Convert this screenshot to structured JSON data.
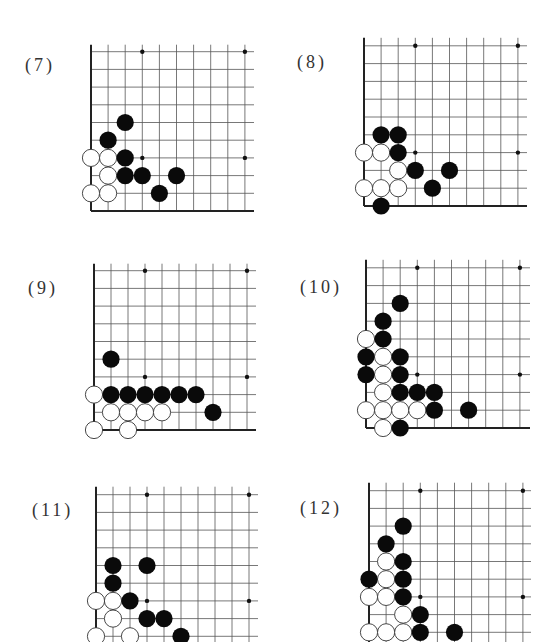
{
  "page": {
    "background": "#ffffff",
    "line_color": "#555555",
    "edge_color": "#222222",
    "black_stone": "#0a0a0a",
    "white_stone": "#ffffff"
  },
  "problems": [
    {
      "label": "(7)",
      "label_pos": [
        25,
        55
      ],
      "origin": [
        91,
        211
      ],
      "step": [
        17.1,
        17.7
      ],
      "cols": 10,
      "rows_shown": 10,
      "top_extra": 7,
      "right_extent": 254,
      "bottom_visible": true,
      "stars": [
        [
          3,
          3
        ],
        [
          9,
          3
        ],
        [
          3,
          9
        ],
        [
          9,
          9
        ]
      ],
      "black": [
        [
          2,
          5
        ],
        [
          1,
          4
        ],
        [
          2,
          3
        ],
        [
          2,
          2
        ],
        [
          3,
          2
        ],
        [
          5,
          2
        ],
        [
          4,
          1
        ]
      ],
      "white": [
        [
          0,
          3
        ],
        [
          1,
          3
        ],
        [
          1,
          2
        ],
        [
          0,
          1
        ],
        [
          1,
          1
        ]
      ]
    },
    {
      "label": "(8)",
      "label_pos": [
        297,
        52
      ],
      "origin": [
        364,
        206
      ],
      "step": [
        17.1,
        17.8
      ],
      "cols": 10,
      "rows_shown": 10,
      "top_extra": 8,
      "right_extent": 527,
      "bottom_visible": true,
      "stars": [
        [
          3,
          3
        ],
        [
          9,
          3
        ],
        [
          3,
          9
        ],
        [
          9,
          9
        ]
      ],
      "black": [
        [
          1,
          4
        ],
        [
          2,
          4
        ],
        [
          2,
          3
        ],
        [
          3,
          2
        ],
        [
          5,
          2
        ],
        [
          4,
          1
        ],
        [
          1,
          0
        ]
      ],
      "white": [
        [
          0,
          3
        ],
        [
          1,
          3
        ],
        [
          2,
          2
        ],
        [
          0,
          1
        ],
        [
          1,
          1
        ],
        [
          2,
          1
        ]
      ]
    },
    {
      "label": "(9)",
      "label_pos": [
        28,
        278
      ],
      "origin": [
        94,
        430
      ],
      "step": [
        17.0,
        17.7
      ],
      "cols": 10,
      "rows_shown": 10,
      "top_extra": 7,
      "right_extent": 256,
      "bottom_visible": true,
      "stars": [
        [
          3,
          3
        ],
        [
          9,
          3
        ],
        [
          3,
          9
        ],
        [
          9,
          9
        ]
      ],
      "black": [
        [
          1,
          4
        ],
        [
          1,
          2
        ],
        [
          2,
          2
        ],
        [
          3,
          2
        ],
        [
          4,
          2
        ],
        [
          5,
          2
        ],
        [
          6,
          2
        ],
        [
          7,
          1
        ]
      ],
      "white": [
        [
          0,
          2
        ],
        [
          1,
          1
        ],
        [
          2,
          1
        ],
        [
          3,
          1
        ],
        [
          4,
          1
        ],
        [
          0,
          0
        ],
        [
          2,
          0
        ]
      ]
    },
    {
      "label": "(10)",
      "label_pos": [
        300,
        277
      ],
      "origin": [
        366,
        428
      ],
      "step": [
        17.1,
        17.8
      ],
      "cols": 10,
      "rows_shown": 10,
      "top_extra": 8,
      "right_extent": 530,
      "bottom_visible": true,
      "stars": [
        [
          3,
          3
        ],
        [
          9,
          3
        ],
        [
          3,
          9
        ],
        [
          9,
          9
        ]
      ],
      "black": [
        [
          2,
          7
        ],
        [
          1,
          6
        ],
        [
          1,
          5
        ],
        [
          0,
          4
        ],
        [
          2,
          4
        ],
        [
          0,
          3
        ],
        [
          2,
          3
        ],
        [
          2,
          2
        ],
        [
          3,
          2
        ],
        [
          4,
          2
        ],
        [
          4,
          1
        ],
        [
          6,
          1
        ],
        [
          2,
          0
        ]
      ],
      "white": [
        [
          0,
          5
        ],
        [
          1,
          4
        ],
        [
          1,
          3
        ],
        [
          1,
          2
        ],
        [
          0,
          1
        ],
        [
          1,
          1
        ],
        [
          2,
          1
        ],
        [
          3,
          1
        ],
        [
          1,
          0
        ]
      ]
    },
    {
      "label": "(11)",
      "label_pos": [
        32,
        500
      ],
      "origin": [
        96,
        654
      ],
      "step": [
        17.0,
        17.7
      ],
      "cols": 10,
      "rows_shown": 10,
      "top_extra": 8,
      "right_extent": 258,
      "bottom_visible": false,
      "stars": [
        [
          3,
          3
        ],
        [
          9,
          3
        ],
        [
          3,
          9
        ],
        [
          9,
          9
        ]
      ],
      "black": [
        [
          1,
          5
        ],
        [
          3,
          5
        ],
        [
          1,
          4
        ],
        [
          2,
          3
        ],
        [
          3,
          2
        ],
        [
          4,
          2
        ],
        [
          5,
          1
        ]
      ],
      "white": [
        [
          0,
          3
        ],
        [
          1,
          3
        ],
        [
          1,
          2
        ],
        [
          0,
          1
        ],
        [
          2,
          1
        ]
      ]
    },
    {
      "label": "(12)",
      "label_pos": [
        300,
        498
      ],
      "origin": [
        369,
        650
      ],
      "step": [
        17.1,
        17.7
      ],
      "cols": 10,
      "rows_shown": 10,
      "top_extra": 8,
      "right_extent": 531,
      "bottom_visible": false,
      "stars": [
        [
          3,
          3
        ],
        [
          9,
          3
        ],
        [
          3,
          9
        ],
        [
          9,
          9
        ]
      ],
      "black": [
        [
          2,
          7
        ],
        [
          1,
          6
        ],
        [
          2,
          5
        ],
        [
          0,
          4
        ],
        [
          2,
          4
        ],
        [
          2,
          3
        ],
        [
          3,
          2
        ],
        [
          3,
          1
        ],
        [
          5,
          1
        ]
      ],
      "white": [
        [
          1,
          5
        ],
        [
          1,
          4
        ],
        [
          0,
          3
        ],
        [
          1,
          3
        ],
        [
          2,
          2
        ],
        [
          0,
          1
        ],
        [
          1,
          1
        ],
        [
          2,
          1
        ]
      ]
    }
  ]
}
